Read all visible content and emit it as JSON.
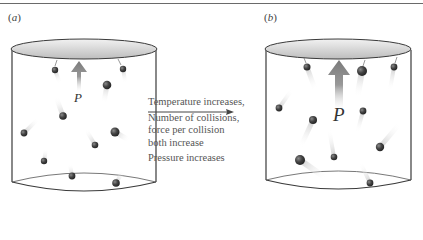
{
  "figure": {
    "panels": [
      {
        "id": "a",
        "label": "a",
        "pressure_label": "P"
      },
      {
        "id": "b",
        "label": "b",
        "pressure_label": "P"
      }
    ],
    "transition": {
      "line1": "Temperature increases,",
      "line2": "Number of collisions,",
      "line3": "force per collision",
      "line4": "both increase",
      "line5": "Pressure increases"
    },
    "colors": {
      "container_stroke": "#3a3a3a",
      "lid_fill": "#d8d8d8",
      "molecule": "#3c3c3c",
      "arrow": "#8a8a8a",
      "text": "#555555"
    }
  }
}
